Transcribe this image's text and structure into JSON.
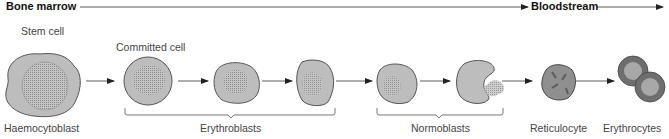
{
  "diagram": {
    "regions": {
      "bone_marrow": "Bone marrow",
      "bloodstream": "Bloodstream"
    },
    "labels": {
      "stem_cell": "Stem cell",
      "committed_cell": "Committed cell",
      "haemocytoblast": "Haemocytoblast",
      "erythroblasts": "Erythroblasts",
      "normoblasts": "Normoblasts",
      "reticulocyte": "Reticulocyte",
      "erythrocytes": "Erythrocytes"
    },
    "stages": [
      "Haemocytoblast",
      "Committed cell",
      "Erythroblast",
      "Erythroblast",
      "Normoblast",
      "Normoblast (nucleus ejected)",
      "Reticulocyte",
      "Erythrocytes"
    ],
    "colors": {
      "cell_fill": "#bdbdbd",
      "cell_stroke": "#555555",
      "nucleus": "#9a9a9a",
      "erythrocyte_rim": "#6e6e6e",
      "erythrocyte_center": "#a8a8a8",
      "arrow": "#222222"
    }
  }
}
